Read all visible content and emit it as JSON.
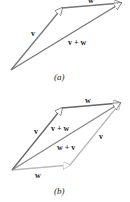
{
  "figure_a": {
    "caption": "(a)",
    "vectors": [
      {
        "name": "v",
        "label": "v",
        "color": "#7a7a7a"
      },
      {
        "name": "w",
        "label": "w",
        "color": "#7a7a7a"
      },
      {
        "name": "v_plus_w",
        "label": "v + w",
        "color": "#7a7a7a"
      }
    ]
  },
  "figure_b": {
    "caption": "(b)",
    "vectors": [
      {
        "name": "v",
        "label": "v",
        "color": "#6e6e6e"
      },
      {
        "name": "w_top",
        "label": "w",
        "color": "#6e6e6e"
      },
      {
        "name": "v_plus_w",
        "label": "v + w",
        "color": "#8a8a8a"
      },
      {
        "name": "w_plus_v_label",
        "label": "w + v",
        "color": "#8a8a8a"
      },
      {
        "name": "w_bottom",
        "label": "w",
        "color": "#bdbdbd"
      },
      {
        "name": "v_right",
        "label": "v",
        "color": "#bdbdbd"
      }
    ]
  }
}
